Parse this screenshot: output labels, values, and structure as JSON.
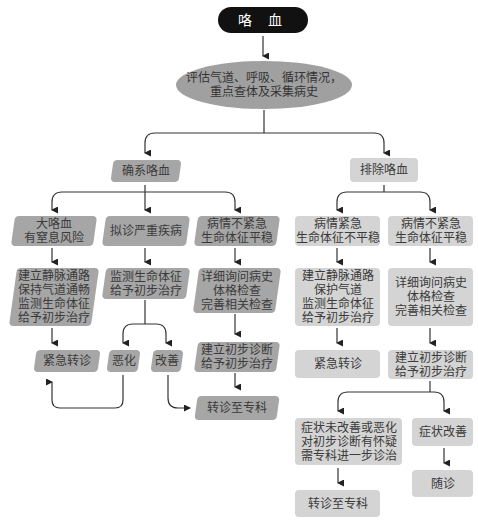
{
  "title": "咯 血",
  "assess": "评估气道、呼吸、循环情况，\n重点查体及采集病史",
  "confirmed": {
    "label": "确系咯血",
    "branches": [
      {
        "condition": "大咯血\n有窒息风险",
        "action": "建立静脉通路\n保持气道通畅\n监测生命体征\n给予初步治疗",
        "outcome": "紧急转诊"
      },
      {
        "condition": "拟诊严重疾病",
        "action": "监测生命体征\n给予初步治疗",
        "outcomes": [
          "恶化",
          "改善"
        ]
      },
      {
        "condition": "病情不紧急\n生命体征平稳",
        "action": "详细询问病史\n体格检查\n完善相关检查",
        "diagnosis": "建立初步诊断\n给予初步治疗",
        "outcome": "转诊至专科"
      }
    ]
  },
  "excluded": {
    "label": "排除咯血",
    "branches": [
      {
        "condition": "病情紧急\n生命体征不平稳",
        "action": "建立静脉通路\n保护气道\n监测生命体征\n给予初步治疗",
        "outcome": "紧急转诊"
      },
      {
        "condition": "病情不紧急\n生命体征平稳",
        "action": "详细询问病史\n体格检查\n完善相关检查",
        "diagnosis": "建立初步诊断\n给予初步治疗",
        "sub": [
          {
            "condition": "症状未改善或恶化\n对初步诊断有怀疑\n需专科进一步诊治",
            "outcome": "转诊至专科"
          },
          {
            "condition": "症状改善",
            "outcome": "随诊"
          }
        ]
      }
    ]
  },
  "colors": {
    "title_bg": "#111111",
    "ellipse": "#a0a0a0",
    "dark_box": "#a6a6a6",
    "light_box": "#d4d4d4",
    "line": "#333333"
  }
}
